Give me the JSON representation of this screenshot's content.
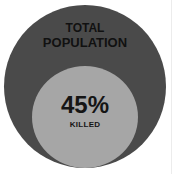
{
  "diagram": {
    "type": "nested-circles",
    "outer": {
      "label_line1": "TOTAL",
      "label_line2": "POPULATION",
      "color": "#4a4a4a"
    },
    "inner": {
      "value": "45%",
      "label": "KILLED",
      "color": "#a6a6a6"
    }
  }
}
